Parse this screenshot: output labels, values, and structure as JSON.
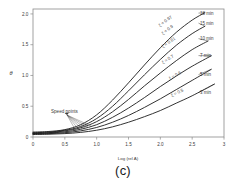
{
  "figure": {
    "caption": "(c)"
  },
  "chart_data": {
    "type": "line",
    "title": "",
    "subtitle": "",
    "xlabel": "Log (rel A)",
    "ylabel": "θ",
    "xlim": [
      0,
      3
    ],
    "ylim": [
      0,
      2.08
    ],
    "xticks": [
      0,
      0.5,
      1,
      1.5,
      2,
      2.5,
      3
    ],
    "xtick_labels": [
      "0",
      "0.5",
      "1.0",
      "1.5",
      "2.0",
      "2.5",
      "3"
    ],
    "yticks": [
      0,
      0.5,
      1,
      1.5,
      2
    ],
    "ytick_labels": [
      "0",
      "0.5",
      "1.0",
      "1.5",
      "2.0"
    ],
    "grid": false,
    "legend_position": "inline-right",
    "annotations": [
      {
        "text": "Speed points",
        "x": 0.38,
        "y": 0.49,
        "note": "label with fan of leader lines pointing to the speed points where curves cross"
      }
    ],
    "series": [
      {
        "name": "18 min",
        "curve_label": "ξ = 0.97",
        "end_label": "18 min",
        "x": [
          0,
          0.25,
          0.5,
          0.75,
          1.0,
          1.25,
          1.5,
          1.75,
          2.0,
          2.25,
          2.5,
          2.7
        ],
        "y": [
          0.08,
          0.09,
          0.12,
          0.2,
          0.36,
          0.6,
          0.88,
          1.17,
          1.45,
          1.7,
          1.9,
          2.02
        ]
      },
      {
        "name": "15 min",
        "curve_label": "ξ = 0.9",
        "end_label": "15 min",
        "x": [
          0,
          0.25,
          0.5,
          0.75,
          1.0,
          1.25,
          1.5,
          1.75,
          2.0,
          2.25,
          2.5,
          2.7
        ],
        "y": [
          0.07,
          0.08,
          0.11,
          0.17,
          0.3,
          0.5,
          0.75,
          1.01,
          1.26,
          1.49,
          1.68,
          1.8
        ]
      },
      {
        "name": "10 min",
        "curve_label": "ξ = 0.81",
        "end_label": "10 min",
        "x": [
          0,
          0.25,
          0.5,
          0.75,
          1.0,
          1.25,
          1.5,
          1.75,
          2.0,
          2.25,
          2.5,
          2.75
        ],
        "y": [
          0.06,
          0.07,
          0.1,
          0.15,
          0.25,
          0.41,
          0.61,
          0.83,
          1.04,
          1.24,
          1.42,
          1.56
        ]
      },
      {
        "name": "7 min",
        "curve_label": "ξ = 0.7",
        "end_label": "7 min",
        "x": [
          0,
          0.25,
          0.5,
          0.75,
          1.0,
          1.25,
          1.5,
          1.75,
          2.0,
          2.25,
          2.5,
          2.8
        ],
        "y": [
          0.055,
          0.065,
          0.085,
          0.125,
          0.2,
          0.32,
          0.47,
          0.64,
          0.82,
          0.99,
          1.15,
          1.32
        ]
      },
      {
        "name": "5 min",
        "curve_label": "ξ = 0.6",
        "end_label": "5 min",
        "x": [
          0,
          0.25,
          0.5,
          0.75,
          1.0,
          1.25,
          1.5,
          1.75,
          2.0,
          2.25,
          2.5,
          2.8
        ],
        "y": [
          0.05,
          0.055,
          0.07,
          0.1,
          0.155,
          0.24,
          0.35,
          0.48,
          0.62,
          0.77,
          0.92,
          1.1
        ]
      },
      {
        "name": "3 min",
        "curve_label": "ξ = 0.5",
        "end_label": "3 min",
        "x": [
          0,
          0.25,
          0.5,
          0.75,
          1.0,
          1.25,
          1.5,
          1.75,
          2.0,
          2.25,
          2.5,
          2.85
        ],
        "y": [
          0.04,
          0.045,
          0.055,
          0.075,
          0.11,
          0.165,
          0.24,
          0.33,
          0.43,
          0.55,
          0.67,
          0.86
        ]
      }
    ]
  }
}
